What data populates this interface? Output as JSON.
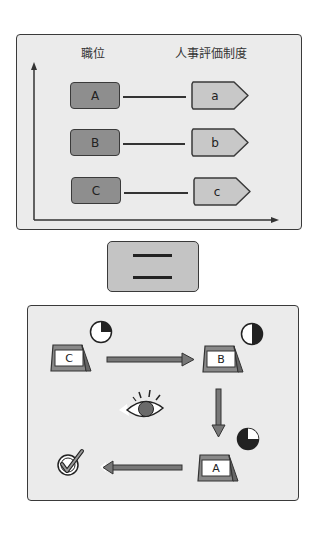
{
  "top_panel": {
    "left_header": "職位",
    "right_header": "人事評価制度",
    "rows": [
      {
        "position": "A",
        "evaluation": "a"
      },
      {
        "position": "B",
        "evaluation": "b"
      },
      {
        "position": "C",
        "evaluation": "c"
      }
    ]
  },
  "equals_symbol": {
    "icon": "equals-icon"
  },
  "bottom_panel": {
    "cards": [
      {
        "label": "C",
        "progress_icon": "pie-quarter-icon",
        "fill": 0.25
      },
      {
        "label": "B",
        "progress_icon": "pie-half-icon",
        "fill": 0.5
      },
      {
        "label": "A",
        "progress_icon": "pie-three-quarter-icon",
        "fill": 0.75
      }
    ],
    "flow": [
      "C",
      "B",
      "A",
      "check"
    ],
    "icons": [
      "eye-icon",
      "checkmark-icon",
      "arrow-right-icon",
      "arrow-down-icon",
      "arrow-left-icon"
    ]
  },
  "colors": {
    "panel_fill": "#ebebeb",
    "border": "#3a3a3a",
    "left_box": "#8e8e8e",
    "right_box": "#c8c8c8",
    "equals_fill": "#c4c4c4",
    "arrow": "#6e6e6e"
  }
}
